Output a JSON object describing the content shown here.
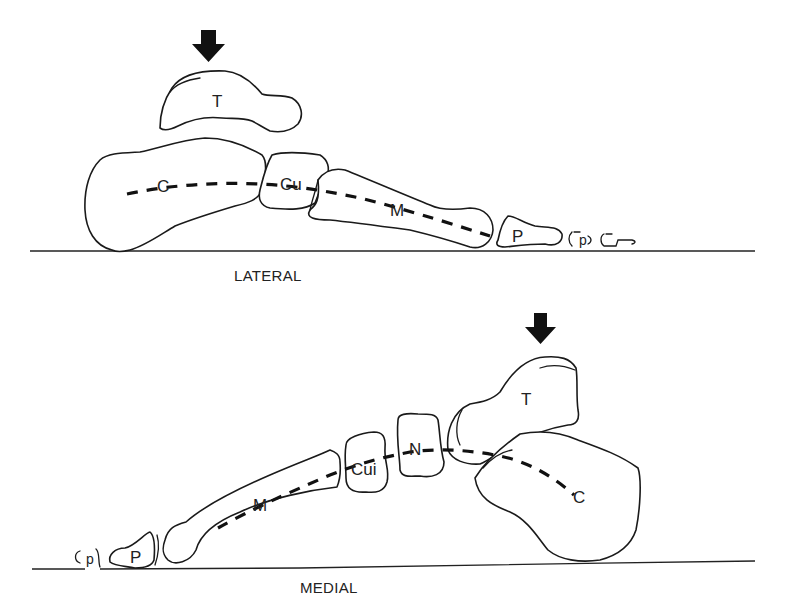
{
  "figure": {
    "panels": [
      {
        "id": "lateral",
        "caption": "LATERAL",
        "labels": {
          "talus": "T",
          "calcaneus": "C",
          "cuboid": "Cu",
          "metatarsal": "M",
          "proximal_phalanx": "P",
          "distal_phalanges": "p"
        },
        "arrow": "load-arrow-down"
      },
      {
        "id": "medial",
        "caption": "MEDIAL",
        "labels": {
          "talus": "T",
          "calcaneus": "C",
          "navicular": "N",
          "cuneiform": "Cui",
          "metatarsal": "M",
          "proximal_phalanx": "P",
          "distal_phalanges": "p"
        },
        "arrow": "load-arrow-down"
      }
    ]
  }
}
